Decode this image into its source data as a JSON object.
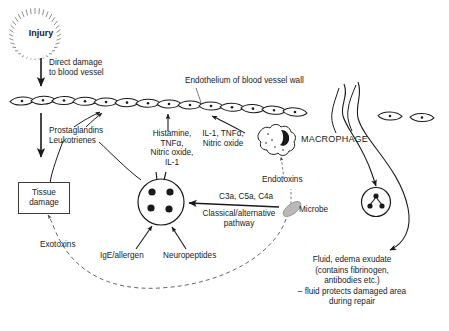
{
  "diagram": {
    "stroke_color": "#1a1a1a",
    "microbe_fill": "#b9b9b9",
    "background": "#ffffff"
  },
  "labels": {
    "injury": "Injury",
    "direct_damage": "Direct damage\nto blood vessel",
    "endothelium": "Endothelium of blood vessel wall",
    "prostaglandins": "Prostaglandins\nLeukotrienes",
    "tissue_damage_line1": "Tissue",
    "tissue_damage_line2": "damage",
    "mediators_left": "Histamine,\nTNFα,\nNitric oxide,\nIL-1",
    "mediators_right": "IL-1, TNFα,\nNitric oxide",
    "macrophage": "MACROPHAGE",
    "endotoxins": "Endotoxins",
    "complement": "C3a, C5a, C4a",
    "pathway": "Classical/alternative\npathway",
    "microbe": "Microbe",
    "exotoxins": "Exotoxins",
    "ige_allergen": "IgE/allergen",
    "neuropeptides": "Neuropeptides",
    "fluid_exudate": "Fluid, edema exudate\n(contains fibrinogen,\nantibodies etc.)\n– fluid protects damaged area\nduring repair"
  },
  "cells": {
    "endothelial_cell_count_left": 12,
    "endothelial_cell_count_right": 2,
    "mast_cell_granules": 4,
    "neutrophil_nucleus_lobes": 3,
    "macrophage_nucleus": "kidney-shaped"
  },
  "icons": {
    "injury_burst": "starburst-icon",
    "mast_cell": "mast-cell-icon",
    "macrophage": "macrophage-icon",
    "neutrophil": "neutrophil-icon",
    "microbe": "microbe-icon",
    "endothelial_cell": "endothelial-cell-icon"
  }
}
